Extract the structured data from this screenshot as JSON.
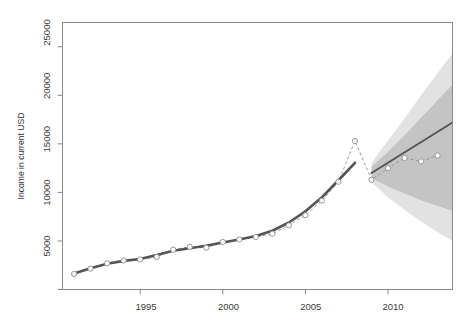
{
  "chart_data": {
    "type": "line",
    "xlabel": "",
    "ylabel": "Income in current USD",
    "grid": false,
    "legend_position": "none",
    "xlim": [
      1990.3,
      2013.9
    ],
    "ylim": [
      0,
      27500
    ],
    "xticks": [
      1995,
      2000,
      2005,
      2010
    ],
    "xtick_labels": [
      "1995",
      "2000",
      "2005",
      "2010"
    ],
    "yticks": [
      0,
      5000,
      10000,
      15000,
      20000,
      25000
    ],
    "ytick_labels": [
      "",
      "5000",
      "10000",
      "15000",
      "20000",
      "25000"
    ],
    "series": [
      {
        "name": "Observed income (open circles, dashed)",
        "style": "dashed-line-with-open-markers",
        "x": [
          1991,
          1992,
          1993,
          1994,
          1995,
          1996,
          1997,
          1998,
          1999,
          2000,
          2001,
          2002,
          2003,
          2004,
          2005,
          2006,
          2007,
          2008,
          2009,
          2010,
          2011,
          2012,
          2013
        ],
        "values": [
          1600,
          2150,
          2700,
          3000,
          3100,
          3350,
          4100,
          4400,
          4300,
          4900,
          5150,
          5400,
          5750,
          6600,
          7650,
          9150,
          11100,
          15300,
          11300,
          12500,
          13550,
          13200,
          13800
        ]
      },
      {
        "name": "Fitted trend (solid, historical)",
        "style": "solid-thick-line",
        "x": [
          1991,
          1992,
          1993,
          1994,
          1995,
          1996,
          1997,
          1998,
          1999,
          2000,
          2001,
          2002,
          2003,
          2004,
          2005,
          2006,
          2007,
          2008
        ],
        "values": [
          1650,
          2200,
          2650,
          2950,
          3150,
          3550,
          4000,
          4250,
          4500,
          4850,
          5150,
          5500,
          6050,
          6900,
          8050,
          9500,
          11250,
          13050
        ]
      },
      {
        "name": "Forecast mean (solid, projected)",
        "style": "solid-line",
        "x": [
          2009,
          2013.9
        ],
        "values": [
          12000,
          17200
        ]
      }
    ],
    "intervals": [
      {
        "name": "80% prediction interval",
        "level": 80,
        "color": "#c4c4c4",
        "x": [
          2009,
          2010,
          2011,
          2012,
          2013,
          2013.9
        ],
        "lower": [
          11450,
          10600,
          9900,
          9200,
          8600,
          8100
        ],
        "upper": [
          12650,
          14200,
          15900,
          17700,
          19500,
          21100
        ]
      },
      {
        "name": "95% prediction interval",
        "level": 95,
        "color": "#e2e2e2",
        "x": [
          2009,
          2010,
          2011,
          2012,
          2013,
          2013.9
        ],
        "lower": [
          11050,
          9500,
          8200,
          7000,
          5900,
          5000
        ],
        "upper": [
          13050,
          15350,
          17600,
          20000,
          22300,
          24300
        ]
      }
    ]
  },
  "axes": {
    "y_label": "Income in current USD",
    "y_tick_25000": "25000",
    "y_tick_20000": "20000",
    "y_tick_15000": "15000",
    "y_tick_10000": "10000",
    "y_tick_5000": "5000",
    "x_tick_1995": "1995",
    "x_tick_2000": "2000",
    "x_tick_2005": "2005",
    "x_tick_2010": "2010"
  },
  "header": {
    "title": ""
  }
}
